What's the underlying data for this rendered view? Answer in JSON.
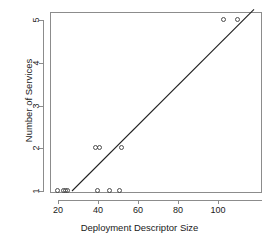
{
  "chart_data": {
    "type": "scatter",
    "title": "",
    "xlabel": "Deployment Descriptor Size",
    "ylabel": "Number of Services",
    "xlim": [
      17,
      119
    ],
    "ylim": [
      0.72,
      5.28
    ],
    "xticks": [
      20,
      40,
      60,
      80,
      100
    ],
    "yticks": [
      1,
      2,
      3,
      4,
      5
    ],
    "grid": false,
    "legend": null,
    "marker": "open-circle",
    "points": [
      {
        "x": 20,
        "y": 1
      },
      {
        "x": 23,
        "y": 1
      },
      {
        "x": 24,
        "y": 1
      },
      {
        "x": 25,
        "y": 1
      },
      {
        "x": 40,
        "y": 1
      },
      {
        "x": 46,
        "y": 1
      },
      {
        "x": 51,
        "y": 1
      },
      {
        "x": 39,
        "y": 2
      },
      {
        "x": 41,
        "y": 2
      },
      {
        "x": 52,
        "y": 2
      },
      {
        "x": 103,
        "y": 5
      },
      {
        "x": 110,
        "y": 5
      }
    ],
    "fit_line": {
      "type": "linear-regression",
      "x_start": 27,
      "y_start": 1,
      "x_end": 118,
      "y_end": 5.25
    }
  }
}
